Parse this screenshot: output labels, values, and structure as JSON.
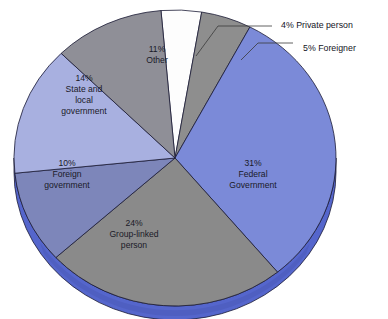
{
  "chart_data": {
    "type": "pie",
    "title": "",
    "subtitle": "",
    "xlabel": "",
    "ylabel": "",
    "legend_position": "none",
    "grid": false,
    "style": "3d-pie",
    "units": "percent",
    "total": 99,
    "categories": [
      "Federal Government",
      "Group-linked person",
      "Foreign government",
      "State and local government",
      "Other",
      "Private person",
      "Foreigner"
    ],
    "values": [
      31,
      24,
      10,
      14,
      11,
      4,
      5
    ],
    "slices": [
      {
        "id": "federal-government",
        "percent": 31,
        "percent_text": "31%",
        "name_lines": [
          "Federal",
          "Government"
        ],
        "label_lines": [
          "31%",
          "Federal",
          "Government"
        ],
        "color": "#7b8ad8",
        "label_placement": "inside",
        "label_x": 253,
        "label_y": 175
      },
      {
        "id": "group-linked-person",
        "percent": 24,
        "percent_text": "24%",
        "name_lines": [
          "Group-linked",
          "person"
        ],
        "label_lines": [
          "24%",
          "Group-linked",
          "person"
        ],
        "color": "#8a8a8a",
        "label_placement": "inside",
        "label_x": 134,
        "label_y": 235
      },
      {
        "id": "foreign-government",
        "percent": 10,
        "percent_text": "10%",
        "name_lines": [
          "Foreign",
          "government"
        ],
        "label_lines": [
          "10%",
          "Foreign",
          "government"
        ],
        "color": "#7d86ba",
        "label_placement": "inside",
        "label_x": 67,
        "label_y": 175
      },
      {
        "id": "state-and-local-government",
        "percent": 14,
        "percent_text": "14%",
        "name_lines": [
          "State and",
          "local",
          "government"
        ],
        "label_lines": [
          "14%",
          "State and",
          "local",
          "government"
        ],
        "color": "#a8b0e0",
        "label_placement": "inside",
        "label_x": 84,
        "label_y": 95
      },
      {
        "id": "other",
        "percent": 11,
        "percent_text": "11%",
        "name_lines": [
          "Other"
        ],
        "label_lines": [
          "11%",
          "Other"
        ],
        "color": "#8f8f97",
        "label_placement": "inside",
        "label_x": 157,
        "label_y": 55
      },
      {
        "id": "private-person",
        "percent": 4,
        "percent_text": "4%",
        "name_lines": [
          "Private person"
        ],
        "label_lines": [
          "4% Private person"
        ],
        "color": "#fdfdfd",
        "label_placement": "callout",
        "label_x": 281,
        "label_y": 20
      },
      {
        "id": "foreigner",
        "percent": 5,
        "percent_text": "5%",
        "name_lines": [
          "Foreigner"
        ],
        "label_lines": [
          "5% Foreigner"
        ],
        "color": "#8e8e8e",
        "label_placement": "callout",
        "label_x": 303,
        "label_y": 43
      }
    ],
    "callouts": [
      {
        "id": "callout-private-person",
        "text": "4% Private person",
        "text_x": 281,
        "text_y": 20
      },
      {
        "id": "callout-foreigner",
        "text": "5% Foreigner",
        "text_x": 303,
        "text_y": 43
      }
    ],
    "colors": {
      "federal_government": "#7b8ad8",
      "group_linked_person": "#8a8a8a",
      "foreign_government": "#7d86ba",
      "state_local_government": "#a8b0e0",
      "other": "#8f8f97",
      "private_person": "#fdfdfd",
      "foreigner": "#8e8e8e",
      "base_rim": "#5566cc",
      "outline": "#1b1b35",
      "background": "#ffffff"
    }
  }
}
